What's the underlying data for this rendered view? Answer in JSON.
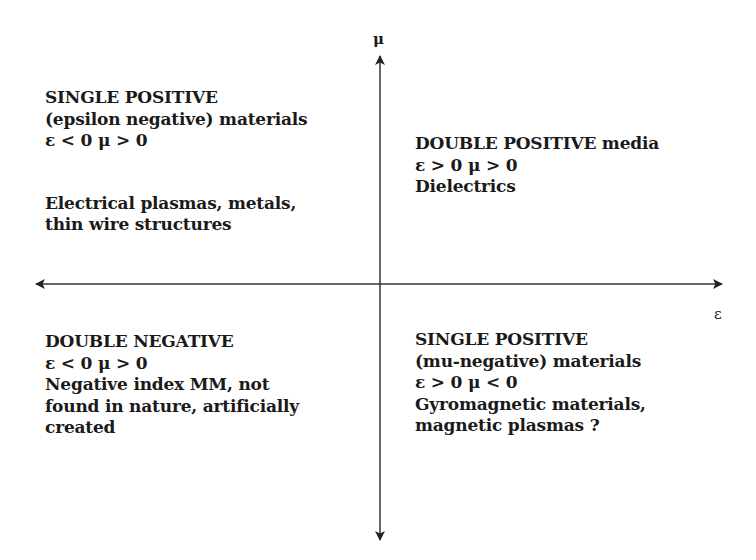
{
  "axes": {
    "vertical_label": "μ",
    "horizontal_label": "ε",
    "color": "#222222"
  },
  "quadrants": {
    "top_left": {
      "heading": "SINGLE POSITIVE",
      "subheading": "(epsilon negative) materials",
      "condition": "ε < 0 μ > 0",
      "examples_line1": "Electrical plasmas, metals,",
      "examples_line2": "thin wire structures"
    },
    "top_right": {
      "heading": "DOUBLE POSITIVE",
      "heading_suffix": " media",
      "condition": "ε > 0 μ > 0",
      "examples_line1": "Dielectrics"
    },
    "bottom_left": {
      "heading": "DOUBLE NEGATIVE",
      "condition": "ε < 0 μ > 0",
      "examples_line1": "Negative index MM, not",
      "examples_line2": "found in nature, artificially",
      "examples_line3": "created"
    },
    "bottom_right": {
      "heading": "SINGLE POSITIVE",
      "subheading": "(mu-negative) materials",
      "condition": "ε > 0 μ < 0",
      "examples_line1": "Gyromagnetic materials,",
      "examples_line2": "magnetic plasmas ?"
    }
  }
}
